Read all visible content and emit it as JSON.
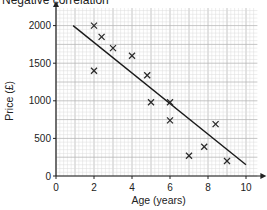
{
  "title": "Negative correlation",
  "chart_data": {
    "type": "scatter",
    "title": "Negative correlation",
    "xlabel": "Age (years)",
    "ylabel": "Price (£)",
    "xlim": [
      0,
      10.5
    ],
    "ylim": [
      0,
      2200
    ],
    "xticks": [
      0,
      2,
      4,
      6,
      8,
      10
    ],
    "yticks": [
      0,
      500,
      1000,
      1500,
      2000
    ],
    "xtick_labels": [
      "0",
      "2",
      "4",
      "6",
      "8",
      "10"
    ],
    "ytick_labels": [
      "0",
      "500",
      "1000",
      "1500",
      "2000"
    ],
    "grid": true,
    "legend": null,
    "points": [
      {
        "x": 2,
        "y": 2000
      },
      {
        "x": 2.4,
        "y": 1850
      },
      {
        "x": 3,
        "y": 1700
      },
      {
        "x": 4,
        "y": 1600
      },
      {
        "x": 2,
        "y": 1400
      },
      {
        "x": 4.8,
        "y": 1340
      },
      {
        "x": 5,
        "y": 980
      },
      {
        "x": 6,
        "y": 980
      },
      {
        "x": 6,
        "y": 740
      },
      {
        "x": 8.4,
        "y": 690
      },
      {
        "x": 7.8,
        "y": 390
      },
      {
        "x": 7,
        "y": 270
      },
      {
        "x": 9,
        "y": 200
      }
    ],
    "line_of_best_fit": {
      "x1": 0.9,
      "y1": 2000,
      "x2": 10,
      "y2": 150
    }
  }
}
